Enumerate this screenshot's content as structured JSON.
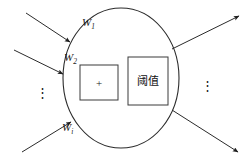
{
  "figure": {
    "background_color": "#ffffff",
    "line_color": "#2b2b2b"
  },
  "soma": {
    "shape": "ellipse",
    "center_x": 121,
    "center_y": 78,
    "radius_x": 58,
    "radius_y": 70
  },
  "inputs": [
    {
      "id": "w1",
      "label": "W",
      "subscript": "1",
      "label_x": 82,
      "label_y": 26,
      "x1": 26,
      "y1": 13,
      "x2": 70,
      "y2": 42
    },
    {
      "id": "w2",
      "label": "W",
      "subscript": "2",
      "label_x": 64,
      "label_y": 61,
      "x1": 14,
      "y1": 50,
      "x2": 63,
      "y2": 74
    },
    {
      "id": "wi",
      "label": "W",
      "subscript": "i",
      "label_x": 62,
      "label_y": 131,
      "x1": 22,
      "y1": 152,
      "x2": 71,
      "y2": 122
    }
  ],
  "input_ellipsis": {
    "glyph": "⋮",
    "x": 42,
    "y": 97
  },
  "output_ellipsis": {
    "glyph": "⋮",
    "x": 207,
    "y": 90
  },
  "outputs": [
    {
      "id": "out-top",
      "x1": 172,
      "y1": 49,
      "x2": 239,
      "y2": 16
    },
    {
      "id": "out-bottom",
      "x1": 172,
      "y1": 110,
      "x2": 238,
      "y2": 152
    }
  ],
  "boxes": [
    {
      "id": "summation",
      "name": "summation-box",
      "text": "+",
      "x": 80,
      "y": 65,
      "width": 38,
      "height": 35,
      "text_class": "box-text-plus"
    },
    {
      "id": "threshold",
      "name": "threshold-box",
      "text": "阈值",
      "x": 128,
      "y": 57,
      "width": 40,
      "height": 48,
      "text_class": "box-text-cn"
    }
  ]
}
